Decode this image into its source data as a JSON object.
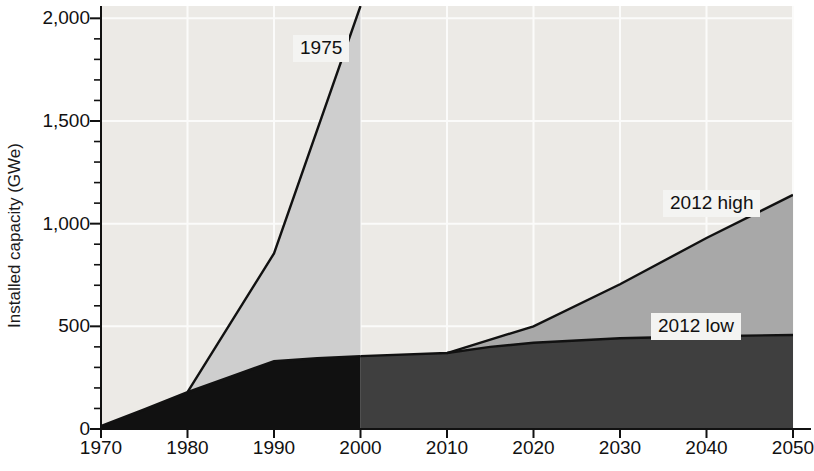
{
  "chart_data": {
    "type": "area",
    "title": "",
    "subtitle": "",
    "xlabel": "",
    "ylabel": "Installed capacity (GWe)",
    "xlim": [
      1970,
      2050
    ],
    "ylim": [
      0,
      2060
    ],
    "xticks": [
      1970,
      1980,
      1990,
      2000,
      2010,
      2020,
      2030,
      2040,
      2050
    ],
    "xtick_labels": [
      "1970",
      "1980",
      "1990",
      "2000",
      "2010",
      "2020",
      "2030",
      "2040",
      "2050"
    ],
    "yticks": [
      0,
      500,
      1000,
      1500,
      2000
    ],
    "ytick_labels": [
      "0",
      "500",
      "1,000",
      "1,500",
      "2,000"
    ],
    "y_minor_tick_step": 100,
    "grid": true,
    "grid_orientation": "both",
    "legend": "inline-callouts",
    "annotations": [
      {
        "text": "1975",
        "x": 1983,
        "y": 1850,
        "name": "1975-projection-label"
      },
      {
        "text": "2012 high",
        "x": 2038,
        "y": 1130,
        "name": "2012-high-label"
      },
      {
        "text": "2012 low",
        "x": 2036,
        "y": 520,
        "name": "2012-low-label"
      }
    ],
    "series": [
      {
        "name": "Historical installed capacity",
        "period": "1970-2000",
        "fill": "#111111",
        "points": [
          {
            "x": 1970,
            "y": 15
          },
          {
            "x": 1975,
            "y": 95
          },
          {
            "x": 1980,
            "y": 180
          },
          {
            "x": 1985,
            "y": 255
          },
          {
            "x": 1990,
            "y": 330
          },
          {
            "x": 1995,
            "y": 345
          },
          {
            "x": 2000,
            "y": 355
          }
        ]
      },
      {
        "name": "Projected installed capacity (2012 low)",
        "period": "2000-2050",
        "fill": "#3f3f3f",
        "points": [
          {
            "x": 2000,
            "y": 355
          },
          {
            "x": 2010,
            "y": 370
          },
          {
            "x": 2015,
            "y": 400
          },
          {
            "x": 2020,
            "y": 420
          },
          {
            "x": 2030,
            "y": 442
          },
          {
            "x": 2040,
            "y": 452
          },
          {
            "x": 2050,
            "y": 458
          }
        ]
      },
      {
        "name": "Projected installed capacity (2012 high)",
        "period": "2010-2050",
        "fill": "#a8a8a8",
        "points": [
          {
            "x": 2010,
            "y": 370
          },
          {
            "x": 2020,
            "y": 500
          },
          {
            "x": 2030,
            "y": 705
          },
          {
            "x": 2040,
            "y": 930
          },
          {
            "x": 2050,
            "y": 1140
          }
        ]
      },
      {
        "name": "1975 projection",
        "period": "1980-2000",
        "fill": "#cecece",
        "points": [
          {
            "x": 1980,
            "y": 180
          },
          {
            "x": 1990,
            "y": 855
          },
          {
            "x": 2000,
            "y": 2060
          }
        ]
      }
    ]
  }
}
